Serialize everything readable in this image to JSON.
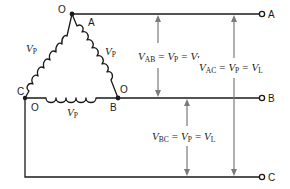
{
  "diagram": {
    "nodes": {
      "top_vertex": "O",
      "top_vertex_terminal": "A",
      "left_vertex": "C",
      "left_vertex_lower": "O",
      "right_vertex_upper": "O",
      "right_vertex": "B"
    },
    "coils": {
      "left": {
        "label": "V",
        "sub": "P"
      },
      "right": {
        "label": "V",
        "sub": "P"
      },
      "bottom": {
        "label": "V",
        "sub": "P"
      }
    },
    "terminals": [
      {
        "label": "A"
      },
      {
        "label": "B"
      },
      {
        "label": "C"
      }
    ],
    "equations": {
      "vab": {
        "v": "V",
        "sub": "AB",
        "eq1": "=",
        "vp": "V",
        "vp_sub": "P",
        "eq2": "=",
        "vl": "V",
        "vl_sub": "L"
      },
      "vac": {
        "v": "V",
        "sub": "AC",
        "eq1": "=",
        "vp": "V",
        "vp_sub": "P",
        "eq2": "=",
        "vl": "V",
        "vl_sub": "L"
      },
      "vbc": {
        "v": "V",
        "sub": "BC",
        "eq1": "=",
        "vp": "V",
        "vp_sub": "P",
        "eq2": "=",
        "vl": "V",
        "vl_sub": "L"
      }
    },
    "colors": {
      "wire": "#1a1a1a",
      "arrow": "#7a7a7a",
      "background": "#ffffff"
    }
  }
}
